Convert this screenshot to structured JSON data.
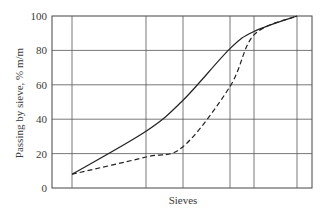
{
  "chart_data": {
    "type": "line",
    "title": "",
    "xlabel": "Sieves",
    "ylabel": "Passing by sieve, % m/m",
    "ylim": [
      0,
      100
    ],
    "yticks": [
      0,
      20,
      40,
      60,
      80,
      100
    ],
    "grid": true,
    "legend": null,
    "x_sieve_positions": [
      1,
      2,
      3,
      4,
      5,
      6
    ],
    "series": [
      {
        "name": "Solid curve",
        "style": "solid",
        "points": [
          [
            1,
            8
          ],
          [
            2,
            33
          ],
          [
            3,
            51
          ],
          [
            4,
            81
          ],
          [
            5,
            91
          ],
          [
            6,
            100
          ]
        ]
      },
      {
        "name": "Dashed curve",
        "style": "dashed",
        "points": [
          [
            1,
            8
          ],
          [
            2,
            18
          ],
          [
            3,
            24
          ],
          [
            4,
            59
          ],
          [
            5,
            89
          ],
          [
            6,
            100
          ]
        ]
      }
    ]
  },
  "labels": {
    "xlabel": "Sieves",
    "ylabel": "Passing by sieve, % m/m",
    "yticks": [
      "0",
      "20",
      "40",
      "60",
      "80",
      "100"
    ]
  }
}
